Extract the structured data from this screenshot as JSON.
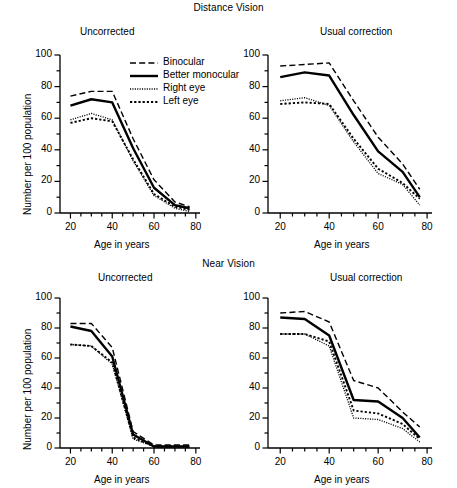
{
  "figure": {
    "section_titles": {
      "distance": "Distance Vision",
      "near": "Near Vision"
    },
    "axis_titles": {
      "x": "Age in years",
      "y": "Number per 100 population"
    },
    "x_ticks": [
      "20",
      "40",
      "60",
      "80"
    ],
    "y_ticks": [
      "0",
      "20",
      "40",
      "60",
      "80",
      "100"
    ],
    "legend": {
      "items": [
        {
          "label": "Binocular",
          "style": "dashed"
        },
        {
          "label": "Better monocular",
          "style": "solid-thick"
        },
        {
          "label": "Right eye",
          "style": "fine-dotted"
        },
        {
          "label": "Left eye",
          "style": "coarse-dotted"
        }
      ]
    }
  },
  "chart_data": [
    {
      "id": "distance-uncorrected",
      "type": "line",
      "title": "Uncorrected",
      "group": "Distance Vision",
      "xlabel": "Age in years",
      "ylabel": "Number per 100 population",
      "xlim": [
        15,
        82
      ],
      "ylim": [
        0,
        100
      ],
      "grid": false,
      "legend_position": "upper-right-inside",
      "x": [
        20,
        30,
        40,
        50,
        60,
        70,
        77
      ],
      "series": [
        {
          "name": "Binocular",
          "style": "dashed",
          "values": [
            74,
            77,
            77,
            47,
            21,
            7,
            4
          ]
        },
        {
          "name": "Better monocular",
          "style": "solid-thick",
          "values": [
            68,
            72,
            70,
            41,
            16,
            5,
            3
          ]
        },
        {
          "name": "Right eye",
          "style": "fine-dotted",
          "values": [
            59,
            63,
            59,
            33,
            11,
            3,
            1
          ]
        },
        {
          "name": "Left eye",
          "style": "coarse-dotted",
          "values": [
            57,
            60,
            58,
            34,
            12,
            4,
            2
          ]
        }
      ]
    },
    {
      "id": "distance-usual-correction",
      "type": "line",
      "title": "Usual correction",
      "group": "Distance Vision",
      "xlabel": "Age in years",
      "ylabel": "Number per 100 population",
      "xlim": [
        15,
        82
      ],
      "ylim": [
        0,
        100
      ],
      "grid": false,
      "legend_position": "none",
      "x": [
        20,
        30,
        40,
        50,
        60,
        70,
        77
      ],
      "series": [
        {
          "name": "Binocular",
          "style": "dashed",
          "values": [
            93,
            94,
            95,
            71,
            48,
            31,
            15
          ]
        },
        {
          "name": "Better monocular",
          "style": "solid-thick",
          "values": [
            86,
            89,
            87,
            62,
            39,
            26,
            10
          ]
        },
        {
          "name": "Right eye",
          "style": "fine-dotted",
          "values": [
            71,
            73,
            68,
            45,
            25,
            18,
            5
          ]
        },
        {
          "name": "Left eye",
          "style": "coarse-dotted",
          "values": [
            69,
            70,
            69,
            47,
            28,
            19,
            9
          ]
        }
      ]
    },
    {
      "id": "near-uncorrected",
      "type": "line",
      "title": "Uncorrected",
      "group": "Near Vision",
      "xlabel": "Age in years",
      "ylabel": "Number per 100 population",
      "xlim": [
        15,
        82
      ],
      "ylim": [
        0,
        100
      ],
      "grid": false,
      "legend_position": "none",
      "x": [
        20,
        30,
        40,
        50,
        60,
        70,
        77
      ],
      "series": [
        {
          "name": "Binocular",
          "style": "dashed",
          "values": [
            83,
            83,
            67,
            11,
            2,
            2,
            2
          ]
        },
        {
          "name": "Better monocular",
          "style": "solid-thick",
          "values": [
            81,
            78,
            61,
            9,
            1,
            1,
            1
          ]
        },
        {
          "name": "Right eye",
          "style": "fine-dotted",
          "values": [
            69,
            68,
            56,
            6,
            1,
            1,
            1
          ]
        },
        {
          "name": "Left eye",
          "style": "coarse-dotted",
          "values": [
            69,
            68,
            57,
            7,
            1,
            1,
            1
          ]
        }
      ]
    },
    {
      "id": "near-usual-correction",
      "type": "line",
      "title": "Usual correction",
      "group": "Near Vision",
      "xlabel": "Age in years",
      "ylabel": "Number per 100 population",
      "xlim": [
        15,
        82
      ],
      "ylim": [
        0,
        100
      ],
      "grid": false,
      "legend_position": "none",
      "x": [
        20,
        30,
        40,
        50,
        60,
        70,
        77
      ],
      "series": [
        {
          "name": "Binocular",
          "style": "dashed",
          "values": [
            90,
            91,
            84,
            45,
            40,
            24,
            14
          ]
        },
        {
          "name": "Better monocular",
          "style": "solid-thick",
          "values": [
            87,
            86,
            75,
            32,
            31,
            20,
            7
          ]
        },
        {
          "name": "Right eye",
          "style": "fine-dotted",
          "values": [
            76,
            76,
            68,
            20,
            19,
            13,
            4
          ]
        },
        {
          "name": "Left eye",
          "style": "coarse-dotted",
          "values": [
            76,
            76,
            71,
            25,
            23,
            16,
            6
          ]
        }
      ]
    }
  ]
}
